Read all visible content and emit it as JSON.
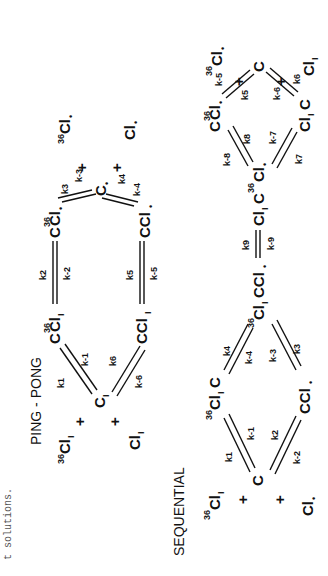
{
  "caption": "t solutions.",
  "ping_pong": {
    "title": "PING - PONG",
    "species": {
      "cl36_in": {
        "label": "Cl",
        "pre": "36",
        "sub": "I"
      },
      "plus_in_1": "+",
      "c_I": {
        "label": "C",
        "sub": "I"
      },
      "plus_in_2": "+",
      "cl_in": {
        "label": "Cl",
        "sub": "I"
      },
      "c36cl_I": {
        "label": "C",
        "pre": "36",
        "mid": "Cl",
        "sub": "I"
      },
      "ccl_I": {
        "label": "CCl",
        "sub": "I"
      },
      "c36cl_dot": {
        "label": "C",
        "pre": "36",
        "mid": "Cl",
        "sub": "•"
      },
      "ccl_dot": {
        "label": "CCl",
        "sub": "•"
      },
      "c_dot": {
        "label": "C",
        "sub": "•"
      },
      "plus_out_1": "+",
      "plus_out_2": "+",
      "cl36_out": {
        "label": "Cl",
        "pre": "36",
        "sub": "•"
      },
      "cl_out": {
        "label": "Cl",
        "sub": "•"
      }
    },
    "rates": {
      "k1": "k1",
      "km1": "k-1",
      "k2": "k2",
      "km2": "k-2",
      "k3": "k3",
      "km3": "k-3",
      "k4": "k4",
      "km4": "k-4",
      "k5": "k5",
      "km5": "k-5",
      "k6": "k6",
      "km6": "k-6"
    }
  },
  "sequential": {
    "title": "SEQUENTIAL",
    "species": {
      "cl36_in": {
        "label": "Cl",
        "pre": "36",
        "sub": "I"
      },
      "plus_in_1": "+",
      "c_in": {
        "label": "C"
      },
      "plus_in_2": "+",
      "cl_in": {
        "label": "Cl",
        "sub": "•"
      },
      "cl36_I_c": {
        "label": "Cl",
        "pre": "36",
        "sub": "I",
        "post": "C"
      },
      "ccl_dot": {
        "label": "CCl",
        "sub": "•"
      },
      "cl36_I_c_cl_dot": {
        "label": "Cl",
        "pre": "36",
        "sub": "I",
        "post": "CCl",
        "post_sub": "•"
      },
      "cl_I_c36_cl_dot": {
        "label": "Cl",
        "sub": "I",
        "post": "C",
        "post_pre": "36",
        "post2": "Cl",
        "post2_sub": "•"
      },
      "c36cl_dot": {
        "label": "C",
        "pre": "36",
        "mid": "Cl",
        "sub": "•"
      },
      "cl_I_c": {
        "label": "Cl",
        "sub": "I",
        "post": "C"
      },
      "c_out": {
        "label": "C"
      },
      "plus_out_1": "+",
      "plus_out_2": "+",
      "cl36_out": {
        "label": "Cl",
        "pre": "36",
        "sub": "•"
      },
      "cl_out": {
        "label": "Cl",
        "sub": "I"
      }
    },
    "rates": {
      "k1": "k1",
      "km1": "k-1",
      "k2": "k2",
      "km2": "k-2",
      "k3": "k3",
      "km3": "k-3",
      "k4": "k4",
      "km4": "k-4",
      "k5": "k5",
      "km5": "k-5",
      "k6": "k6",
      "km6": "k-6",
      "k7": "k7",
      "km7": "k-7",
      "k8": "k8",
      "km8": "k-8",
      "k9": "k9",
      "km9": "k-9"
    }
  }
}
